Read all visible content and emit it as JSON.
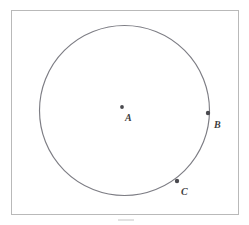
{
  "figure": {
    "type": "geometry-diagram",
    "frame": {
      "x": 11,
      "y": 10,
      "width": 227,
      "height": 204,
      "stroke_color": "#b9b9b9"
    },
    "circle": {
      "center_x": 124.5,
      "center_y": 110.5,
      "radius": 85,
      "stroke_color": "#7d7d84",
      "fill": "none"
    },
    "points": [
      {
        "id": "A",
        "label": "A",
        "role": "center",
        "dot_x": 122,
        "dot_y": 107,
        "label_x": 125,
        "label_y": 121,
        "dot_radius": 1.9,
        "color": "#4a4a4f"
      },
      {
        "id": "B",
        "label": "B",
        "role": "on-circle",
        "dot_x": 208,
        "dot_y": 113,
        "label_x": 214,
        "label_y": 128,
        "dot_radius": 2.2,
        "color": "#4a4a4f"
      },
      {
        "id": "C",
        "label": "C",
        "role": "on-circle",
        "dot_x": 177,
        "dot_y": 181,
        "label_x": 181,
        "label_y": 195,
        "dot_radius": 2.2,
        "color": "#4a4a4f"
      }
    ],
    "caption": {
      "text": "",
      "visible": false
    }
  }
}
